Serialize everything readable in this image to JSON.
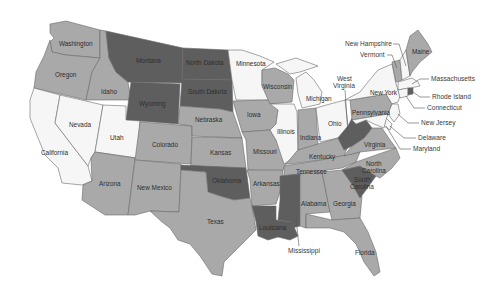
{
  "map": {
    "type": "choropleth",
    "region": "United States (contiguous 48)",
    "palette": {
      "dark": "#5e5e5e",
      "medium": "#a9a9a9",
      "light": "#f6f6f6",
      "border": "#6a6a6a",
      "background": "#ffffff"
    },
    "states": {
      "washington": {
        "label": "Washington",
        "shade": "medium"
      },
      "oregon": {
        "label": "Oregon",
        "shade": "medium"
      },
      "california": {
        "label": "California",
        "shade": "light"
      },
      "nevada": {
        "label": "Nevada",
        "shade": "light"
      },
      "idaho": {
        "label": "Idaho",
        "shade": "medium"
      },
      "montana": {
        "label": "Montana",
        "shade": "dark"
      },
      "wyoming": {
        "label": "Wyoming",
        "shade": "dark"
      },
      "utah": {
        "label": "Utah",
        "shade": "light"
      },
      "arizona": {
        "label": "Arizona",
        "shade": "medium"
      },
      "colorado": {
        "label": "Colorado",
        "shade": "medium"
      },
      "new_mexico": {
        "label": "New Mexico",
        "shade": "medium"
      },
      "north_dakota": {
        "label": "North Dakota",
        "shade": "dark"
      },
      "south_dakota": {
        "label": "South Dakota",
        "shade": "dark"
      },
      "nebraska": {
        "label": "Nebraska",
        "shade": "medium"
      },
      "kansas": {
        "label": "Kansas",
        "shade": "medium"
      },
      "oklahoma": {
        "label": "Oklahoma",
        "shade": "dark"
      },
      "texas": {
        "label": "Texas",
        "shade": "medium"
      },
      "minnesota": {
        "label": "Minnesota",
        "shade": "light"
      },
      "iowa": {
        "label": "Iowa",
        "shade": "medium"
      },
      "missouri": {
        "label": "Missouri",
        "shade": "medium"
      },
      "arkansas": {
        "label": "Arkansas",
        "shade": "medium"
      },
      "louisiana": {
        "label": "Louisiana",
        "shade": "dark"
      },
      "wisconsin": {
        "label": "Wisconsin",
        "shade": "medium"
      },
      "illinois": {
        "label": "Illinois",
        "shade": "light"
      },
      "michigan": {
        "label": "Michigan",
        "shade": "light"
      },
      "indiana": {
        "label": "Indiana",
        "shade": "medium"
      },
      "ohio": {
        "label": "Ohio",
        "shade": "light"
      },
      "kentucky": {
        "label": "Kentucky",
        "shade": "medium"
      },
      "tennessee": {
        "label": "Tennessee",
        "shade": "medium"
      },
      "mississippi": {
        "label": "Mississippi",
        "shade": "dark"
      },
      "alabama": {
        "label": "Alabama",
        "shade": "medium"
      },
      "georgia": {
        "label": "Georgia",
        "shade": "medium"
      },
      "florida": {
        "label": "Florida",
        "shade": "medium"
      },
      "south_carolina": {
        "label_line1": "South",
        "label_line2": "Carolina",
        "shade": "dark"
      },
      "north_carolina": {
        "label_line1": "North",
        "label_line2": "Carolina",
        "shade": "medium"
      },
      "virginia": {
        "label": "Virginia",
        "shade": "medium"
      },
      "west_virginia": {
        "label_line1": "West",
        "label_line2": "Virginia",
        "shade": "dark"
      },
      "pennsylvania": {
        "label": "Pennsylvania",
        "shade": "medium"
      },
      "new_york": {
        "label": "New York",
        "shade": "light"
      },
      "vermont": {
        "label": "Vermont",
        "shade": "medium"
      },
      "new_hampshire": {
        "label": "New Hampshire",
        "shade": "light"
      },
      "maine": {
        "label": "Maine",
        "shade": "medium"
      },
      "massachusetts": {
        "label": "Massachusetts",
        "shade": "light"
      },
      "rhode_island": {
        "label": "Rhode Island",
        "shade": "dark"
      },
      "connecticut": {
        "label": "Connecticut",
        "shade": "light"
      },
      "new_jersey": {
        "label": "New Jersey",
        "shade": "light"
      },
      "delaware": {
        "label": "Delaware",
        "shade": "light"
      },
      "maryland": {
        "label": "Maryland",
        "shade": "light"
      }
    }
  }
}
